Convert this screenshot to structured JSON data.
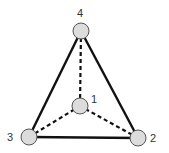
{
  "diagram": {
    "type": "graph",
    "colors": {
      "background": "#ffffff",
      "node_fill": "#dcdcdc",
      "node_stroke": "#555555",
      "edge": "#111111",
      "label": "#333333"
    },
    "nodes": [
      {
        "id": "1",
        "label": "1",
        "cx": 80,
        "cy": 106,
        "r": 8,
        "label_x": 94,
        "label_y": 103
      },
      {
        "id": "2",
        "label": "2",
        "cx": 138,
        "cy": 138,
        "r": 8,
        "label_x": 151,
        "label_y": 142
      },
      {
        "id": "3",
        "label": "3",
        "cx": 29,
        "cy": 137,
        "r": 8,
        "label_x": 8,
        "label_y": 141
      },
      {
        "id": "4",
        "label": "4",
        "cx": 81,
        "cy": 31,
        "r": 8,
        "label_x": 78,
        "label_y": 17
      }
    ],
    "edges": [
      {
        "from": "4",
        "to": "3",
        "style": "solid"
      },
      {
        "from": "4",
        "to": "2",
        "style": "solid"
      },
      {
        "from": "3",
        "to": "2",
        "style": "solid"
      },
      {
        "from": "4",
        "to": "1",
        "style": "dashed"
      },
      {
        "from": "3",
        "to": "1",
        "style": "dashed"
      },
      {
        "from": "2",
        "to": "1",
        "style": "dashed"
      }
    ]
  }
}
